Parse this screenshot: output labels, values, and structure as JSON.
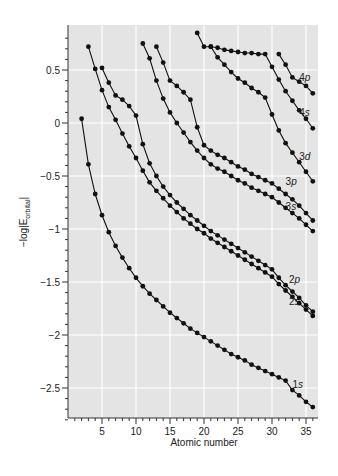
{
  "chart_data": {
    "type": "line",
    "title": "",
    "xlabel": "Atomic number",
    "ylabel": "-log|E_orbital|",
    "ylabel_main": "−log|E",
    "ylabel_sub": "orbital",
    "ylabel_end": "|",
    "xlim": [
      1,
      37
    ],
    "ylim": [
      -2.8,
      0.9
    ],
    "xticks": [
      5,
      10,
      15,
      20,
      25,
      30,
      35
    ],
    "xtick_labels": [
      "5",
      "10",
      "15",
      "20",
      "25",
      "30",
      "35"
    ],
    "yticks": [
      0.5,
      0,
      -0.5,
      -1,
      -1.5,
      -2,
      -2.5
    ],
    "ytick_labels": [
      "0.5",
      "0",
      "−0.5",
      "−1",
      "−1.5",
      "−2",
      "−2.5"
    ],
    "grid": true,
    "background": "#e4e4e4",
    "series": [
      {
        "name": "1s",
        "label_pos": [
          33.0,
          -2.47
        ],
        "x": [
          2,
          3,
          4,
          5,
          6,
          7,
          8,
          9,
          10,
          11,
          12,
          13,
          14,
          15,
          16,
          17,
          18,
          19,
          20,
          21,
          22,
          23,
          24,
          25,
          26,
          27,
          28,
          29,
          30,
          31,
          32,
          33,
          34,
          35,
          36
        ],
        "values": [
          0.04,
          -0.39,
          -0.67,
          -0.87,
          -1.03,
          -1.16,
          -1.27,
          -1.37,
          -1.46,
          -1.54,
          -1.61,
          -1.67,
          -1.73,
          -1.79,
          -1.84,
          -1.89,
          -1.94,
          -1.98,
          -2.02,
          -2.06,
          -2.1,
          -2.14,
          -2.18,
          -2.21,
          -2.24,
          -2.28,
          -2.31,
          -2.34,
          -2.37,
          -2.4,
          -2.43,
          -2.52,
          -2.57,
          -2.63,
          -2.68
        ]
      },
      {
        "name": "2s",
        "label_pos": [
          32.5,
          -1.69
        ],
        "x": [
          3,
          4,
          5,
          6,
          7,
          8,
          9,
          10,
          11,
          12,
          13,
          14,
          15,
          16,
          17,
          18,
          19,
          20,
          21,
          22,
          23,
          24,
          25,
          26,
          27,
          28,
          29,
          30,
          31,
          32,
          33,
          34,
          35,
          36
        ],
        "values": [
          0.72,
          0.51,
          0.31,
          0.15,
          0.03,
          -0.1,
          -0.22,
          -0.33,
          -0.45,
          -0.56,
          -0.64,
          -0.71,
          -0.78,
          -0.84,
          -0.9,
          -0.95,
          -1.0,
          -1.04,
          -1.09,
          -1.13,
          -1.17,
          -1.21,
          -1.25,
          -1.29,
          -1.33,
          -1.37,
          -1.41,
          -1.45,
          -1.52,
          -1.58,
          -1.64,
          -1.7,
          -1.76,
          -1.82
        ]
      },
      {
        "name": "2p",
        "label_pos": [
          32.5,
          -1.48
        ],
        "x": [
          5,
          6,
          7,
          8,
          9,
          10,
          11,
          12,
          13,
          14,
          15,
          16,
          17,
          18,
          19,
          20,
          21,
          22,
          23,
          24,
          25,
          26,
          27,
          28,
          29,
          30,
          31,
          32,
          33,
          34,
          35,
          36
        ],
        "values": [
          0.52,
          0.38,
          0.26,
          0.22,
          0.16,
          0.07,
          -0.2,
          -0.38,
          -0.5,
          -0.6,
          -0.68,
          -0.75,
          -0.81,
          -0.87,
          -0.92,
          -0.97,
          -1.02,
          -1.06,
          -1.1,
          -1.14,
          -1.18,
          -1.22,
          -1.26,
          -1.3,
          -1.34,
          -1.38,
          -1.46,
          -1.53,
          -1.59,
          -1.65,
          -1.72,
          -1.78
        ]
      },
      {
        "name": "3s",
        "label_pos": [
          32.0,
          -0.79
        ],
        "x": [
          11,
          12,
          13,
          14,
          15,
          16,
          17,
          18,
          19,
          20,
          21,
          22,
          23,
          24,
          25,
          26,
          27,
          28,
          29,
          30,
          31,
          32,
          33,
          34,
          35,
          36
        ],
        "values": [
          0.75,
          0.61,
          0.4,
          0.23,
          0.1,
          0.0,
          -0.09,
          -0.18,
          -0.26,
          -0.33,
          -0.39,
          -0.43,
          -0.46,
          -0.5,
          -0.54,
          -0.57,
          -0.61,
          -0.64,
          -0.67,
          -0.7,
          -0.75,
          -0.8,
          -0.85,
          -0.9,
          -0.96,
          -1.02
        ]
      },
      {
        "name": "3p",
        "label_pos": [
          32.0,
          -0.56
        ],
        "x": [
          13,
          14,
          15,
          16,
          17,
          18,
          19,
          20,
          21,
          22,
          23,
          24,
          25,
          26,
          27,
          28,
          29,
          30,
          31,
          32,
          33,
          34,
          35,
          36
        ],
        "values": [
          0.72,
          0.57,
          0.4,
          0.35,
          0.29,
          0.22,
          -0.04,
          -0.21,
          -0.26,
          -0.3,
          -0.33,
          -0.37,
          -0.41,
          -0.44,
          -0.48,
          -0.51,
          -0.54,
          -0.57,
          -0.62,
          -0.67,
          -0.72,
          -0.78,
          -0.85,
          -0.92
        ]
      },
      {
        "name": "3d",
        "label_pos": [
          34.0,
          -0.32
        ],
        "x": [
          21,
          22,
          23,
          24,
          25,
          26,
          27,
          28,
          29,
          30,
          31,
          32,
          33,
          34,
          35,
          36
        ],
        "values": [
          0.72,
          0.62,
          0.55,
          0.48,
          0.42,
          0.38,
          0.33,
          0.29,
          0.24,
          0.08,
          -0.07,
          -0.19,
          -0.28,
          -0.37,
          -0.46,
          -0.55
        ]
      },
      {
        "name": "4s",
        "label_pos": [
          34.0,
          0.09
        ],
        "x": [
          19,
          20,
          21,
          22,
          23,
          24,
          25,
          26,
          27,
          28,
          29,
          30,
          31,
          32,
          33,
          34,
          35,
          36
        ],
        "values": [
          0.85,
          0.72,
          0.72,
          0.71,
          0.69,
          0.68,
          0.67,
          0.66,
          0.66,
          0.65,
          0.65,
          0.53,
          0.41,
          0.3,
          0.21,
          0.12,
          0.04,
          -0.05
        ]
      },
      {
        "name": "4p",
        "label_pos": [
          34.0,
          0.42
        ],
        "x": [
          31,
          32,
          33,
          34,
          35,
          36
        ],
        "values": [
          0.65,
          0.55,
          0.43,
          0.39,
          0.35,
          0.28
        ]
      }
    ]
  }
}
